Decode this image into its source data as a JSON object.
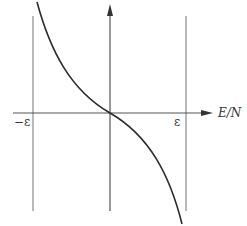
{
  "diagram": {
    "x_axis": {
      "label": "E/N",
      "arrow": true
    },
    "y_axis": {
      "label": "",
      "arrow": true
    },
    "ticks": {
      "left": "−ε",
      "right": "ε"
    },
    "colors": {
      "line": "#555555",
      "curve": "#2b2b2b",
      "text": "#333333"
    }
  }
}
